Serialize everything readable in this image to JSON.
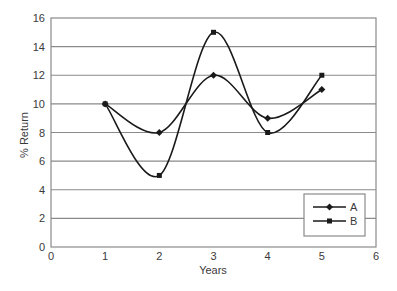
{
  "chart_data": {
    "type": "line",
    "title": "",
    "xlabel": "Years",
    "ylabel": "% Return",
    "x": [
      1,
      2,
      3,
      4,
      5
    ],
    "xlim": [
      0,
      6
    ],
    "ylim": [
      0,
      16
    ],
    "xticks": [
      0,
      1,
      2,
      3,
      4,
      5,
      6
    ],
    "yticks": [
      0,
      2,
      4,
      6,
      8,
      10,
      12,
      14,
      16
    ],
    "grid": "horizontal",
    "smooth": true,
    "legend_position": "lower right inside",
    "series": [
      {
        "name": "A",
        "marker": "diamond",
        "values": [
          10,
          8,
          12,
          9,
          11
        ]
      },
      {
        "name": "B",
        "marker": "square",
        "values": [
          10,
          5,
          15,
          8,
          12
        ]
      }
    ]
  },
  "colors": {
    "line": "#1a1a1a",
    "grid": "#8a8a8a",
    "frame": "#8a8a8a",
    "text": "#3a3a3a",
    "background": "#ffffff"
  }
}
